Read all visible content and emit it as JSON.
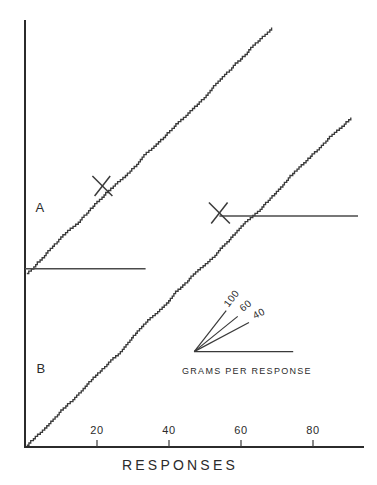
{
  "figure": {
    "background_color": "#ffffff",
    "ink_color": "#2b2b2b"
  },
  "chart_data": {
    "type": "line",
    "title": "",
    "subtitle": "",
    "xlabel": "RESPONSES",
    "ylabel": "",
    "grid": false,
    "legend_position": "inset-center-right",
    "xlim": [
      0,
      98
    ],
    "ylim": [
      0,
      118
    ],
    "xticks": [
      20,
      40,
      60,
      80
    ],
    "xticklabels": [
      "20",
      "40",
      "60",
      "80"
    ],
    "yticks": [],
    "yticklabels": [],
    "annotations": [
      {
        "name": "curve-a-label",
        "text": "A",
        "x": 4,
        "y": 66
      },
      {
        "name": "curve-b-label",
        "text": "B",
        "x": 4.5,
        "y": 24
      },
      {
        "name": "curve-a-extinction-mark",
        "text": "X",
        "x": 21.5,
        "y": 72.5
      },
      {
        "name": "curve-b-extinction-mark",
        "text": "X",
        "x": 54,
        "y": 65
      }
    ],
    "reference_lines": [
      {
        "name": "baseline-reference-a",
        "y": 49.5,
        "x_start": 0,
        "x_end": 33.5
      },
      {
        "name": "baseline-reference-b",
        "y": 64.2,
        "x_start": 54,
        "x_end": 92.5
      }
    ],
    "series": [
      {
        "name": "A",
        "label": "A",
        "description": "cumulative response record A",
        "start": {
          "x": 0.5,
          "y": 48.2
        },
        "end": {
          "x": 68.5,
          "y": 116.5
        },
        "extinction_point": {
          "x": 21.5,
          "y": 72.5
        },
        "step_count": 110
      },
      {
        "name": "B",
        "label": "B",
        "description": "cumulative response record B",
        "start": {
          "x": 0.5,
          "y": 0.5
        },
        "end": {
          "x": 90.5,
          "y": 91.5
        },
        "extinction_point": {
          "x": 54,
          "y": 65
        },
        "step_count": 150
      }
    ],
    "legend": {
      "title": "GRAMS PER RESPONSE",
      "apex": {
        "x": 47,
        "y": 26.5
      },
      "baseline_end": {
        "x": 74.5,
        "y": 26.5
      },
      "rays": [
        {
          "label": "100",
          "angle_deg": 52,
          "length": 52
        },
        {
          "label": "60",
          "angle_deg": 39,
          "length": 56
        },
        {
          "label": "40",
          "angle_deg": 28,
          "length": 62
        }
      ]
    }
  }
}
